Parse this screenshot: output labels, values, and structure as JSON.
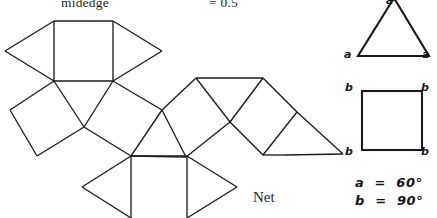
{
  "figure": {
    "caption": "Net",
    "header": {
      "midedge_label": "midedge",
      "value_label": "= 0.5"
    },
    "legend": {
      "angle_a": "a  =  60°",
      "angle_b": "b  =  90°"
    },
    "key_triangle": {
      "name": "equilateral-triangle-key",
      "vertex_labels": {
        "apex": "a",
        "left": "a",
        "right": "a"
      }
    },
    "key_square": {
      "name": "square-key",
      "vertex_labels": {
        "top_left": "b",
        "top_right": "b",
        "bottom_left": "b",
        "bottom_right": "b"
      }
    },
    "colors": {
      "stroke": "#1d1d1d",
      "background": "#ffffff",
      "text": "#1a1a1a"
    },
    "net": {
      "description": "Unfolded polyhedron net of squares and equilateral triangles",
      "square_count": 6,
      "triangle_count": 8,
      "polygons": [
        {
          "name": "square-top-left",
          "type": "square",
          "points": "54,21 113,21 113,81 54,81"
        },
        {
          "name": "triangle-top-far-left",
          "type": "triangle",
          "points": "54,21 5,51 54,81"
        },
        {
          "name": "triangle-top-right",
          "type": "triangle",
          "points": "113,21 162,51 113,81"
        },
        {
          "name": "square-left-tilted",
          "type": "square",
          "points": "54,81 10,110 37,156 84,127"
        },
        {
          "name": "triangle-center-left",
          "type": "triangle",
          "points": "54,81 84,127 113,81"
        },
        {
          "name": "square-center-tilted",
          "type": "square",
          "points": "113,81 84,127 131,156 162,110"
        },
        {
          "name": "triangle-mid-upper",
          "type": "triangle",
          "points": "162,110 131,156 186,157"
        },
        {
          "name": "square-mid-upper",
          "type": "square",
          "points": "162,110 196,78 230,122 186,157"
        },
        {
          "name": "triangle-mid-peak",
          "type": "triangle",
          "points": "196,78 263,78 230,122"
        },
        {
          "name": "square-right-tilted",
          "type": "square",
          "points": "263,78 297,112 263,155 230,122"
        },
        {
          "name": "triangle-right-outer",
          "type": "triangle",
          "points": "297,112 343,154 285,155"
        },
        {
          "name": "square-bottom",
          "type": "square",
          "points": "131,156 187,156 187,218 131,218"
        },
        {
          "name": "triangle-bottom-left",
          "type": "triangle",
          "points": "131,156 82,187 131,218"
        },
        {
          "name": "triangle-bottom-right",
          "type": "triangle",
          "points": "187,156 237,187 187,218"
        }
      ],
      "edges": [
        "54,21 113,21",
        "113,21 113,81",
        "113,81 54,81",
        "54,81 54,21",
        "54,21 5,51",
        "5,51 54,81",
        "113,21 162,51",
        "162,51 113,81",
        "54,81 10,110",
        "10,110 37,156",
        "37,156 84,127",
        "84,127 54,81",
        "84,127 113,81",
        "84,127 131,156",
        "131,156 162,110",
        "162,110 113,81",
        "131,156 186,157",
        "186,157 162,110",
        "162,110 196,78",
        "196,78 230,122",
        "230,122 186,157",
        "196,78 263,78",
        "263,78 230,122",
        "263,78 297,112",
        "297,112 263,155",
        "263,155 230,122",
        "297,112 343,154",
        "343,154 285,155",
        "285,155 263,155",
        "131,156 187,156",
        "187,156 187,218",
        "131,156 131,218",
        "131,156 82,187",
        "82,187 131,218",
        "187,156 237,187",
        "237,187 187,218"
      ]
    }
  }
}
